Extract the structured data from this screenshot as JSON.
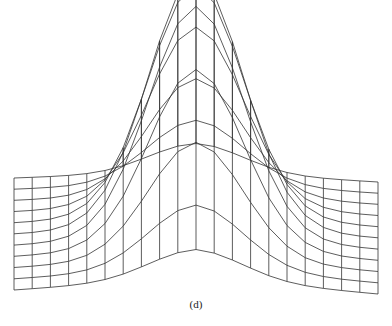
{
  "figure": {
    "caption": "(d)",
    "type": "3d-wireframe-surface",
    "line_color": "#333333",
    "background": "#ffffff"
  },
  "mesh": {
    "columns": 21,
    "rows": 11,
    "x_left": 14,
    "x_right": 378,
    "front_y_left": 290,
    "front_y_center": 278,
    "front_y_right": 294,
    "back_y_left": 178,
    "back_y_center": 172,
    "back_y_right": 182,
    "peak_height": 250,
    "peak_sigma_cols": 2.6,
    "peak_sigma_rows": 2.4,
    "peak_row": 5
  }
}
